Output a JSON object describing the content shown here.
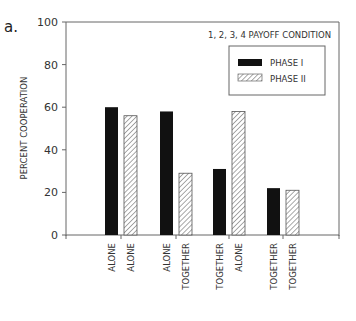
{
  "panel_label": "a.",
  "chart_data": {
    "type": "bar",
    "title": "1, 2, 3, 4 PAYOFF CONDITION",
    "xlabel": "",
    "ylabel": "PERCENT COOPERATION",
    "ylim": [
      0,
      100
    ],
    "yticks": [
      0,
      20,
      40,
      60,
      80,
      100
    ],
    "grid": false,
    "legend_position": "upper right",
    "categories": [
      [
        "ALONE",
        "ALONE"
      ],
      [
        "ALONE",
        "TOGETHER"
      ],
      [
        "TOGETHER",
        "ALONE"
      ],
      [
        "TOGETHER",
        "TOGETHER"
      ]
    ],
    "series": [
      {
        "name": "PHASE I",
        "pattern": "solid",
        "color": "#111111",
        "values": [
          60,
          58,
          31,
          22
        ]
      },
      {
        "name": "PHASE II",
        "pattern": "hatched",
        "color": "#ffffff",
        "values": [
          56,
          29,
          58,
          21
        ]
      }
    ]
  }
}
